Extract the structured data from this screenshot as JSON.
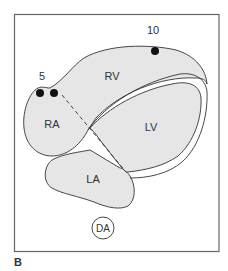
{
  "figure": {
    "panel_label": "B",
    "colors": {
      "chamber_fill": "#e6e6e6",
      "outline": "#333333",
      "frame": "#666666",
      "marker": "#111111",
      "background": "#ffffff"
    },
    "chambers": {
      "rv": "RV",
      "ra": "RA",
      "lv": "LV",
      "la": "LA"
    },
    "markers": [
      {
        "label": "5",
        "count": 2
      },
      {
        "label": "10",
        "count": 1
      }
    ],
    "aorta_label": "DA",
    "annotation": "dashed line from RA marker through septum to LV/LA junction"
  }
}
